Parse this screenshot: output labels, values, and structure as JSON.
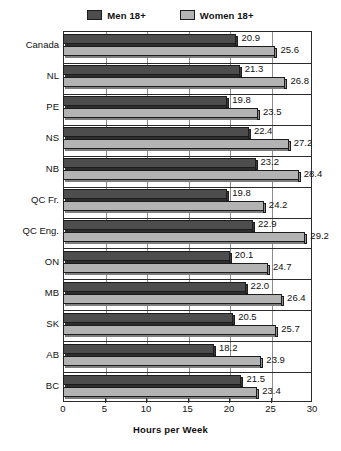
{
  "chart_data": {
    "type": "bar",
    "orientation": "horizontal",
    "title": "",
    "xlabel": "Hours per Week",
    "ylabel": "",
    "xlim": [
      0,
      30
    ],
    "xticks": [
      0,
      5,
      10,
      15,
      20,
      25,
      30
    ],
    "grid": true,
    "legend_position": "top-center",
    "categories": [
      "Canada",
      "NL",
      "PE",
      "NS",
      "NB",
      "QC Fr.",
      "QC Eng.",
      "ON",
      "MB",
      "SK",
      "AB",
      "BC"
    ],
    "series": [
      {
        "name": "Men 18+",
        "color": "#4d4d4d",
        "values": [
          20.9,
          21.3,
          19.8,
          22.4,
          23.2,
          19.8,
          22.9,
          20.1,
          22.0,
          20.5,
          18.2,
          21.5
        ]
      },
      {
        "name": "Women 18+",
        "color": "#b3b3b3",
        "values": [
          25.6,
          26.8,
          23.5,
          27.2,
          28.4,
          24.2,
          29.2,
          24.7,
          26.4,
          25.7,
          23.9,
          23.4
        ]
      }
    ]
  },
  "legend": {
    "entries": [
      {
        "label": "Men 18+",
        "swatch": "men-swatch-icon"
      },
      {
        "label": "Women 18+",
        "swatch": "women-swatch-icon"
      }
    ]
  },
  "axis": {
    "x_title": "Hours per Week",
    "x_tick_labels": [
      "0",
      "5",
      "10",
      "15",
      "20",
      "25",
      "30"
    ]
  }
}
